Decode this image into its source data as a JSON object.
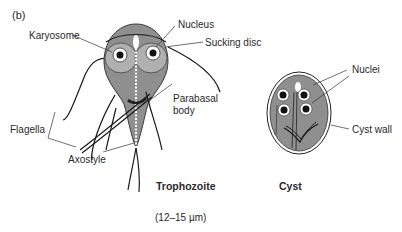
{
  "figure": {
    "panel_label": "(b)",
    "labels": {
      "karyosome": "Karyosome",
      "nucleus": "Nucleus",
      "sucking_disc": "Sucking disc",
      "parabasal_body_line1": "Parabasal",
      "parabasal_body_line2": "body",
      "flagella": "Flagella",
      "axostyle": "Axostyle",
      "nuclei": "Nuclei",
      "cyst_wall": "Cyst wall"
    },
    "captions": {
      "trophozoite": "Trophozoite",
      "cyst": "Cyst",
      "size": "(12–15 µm)"
    },
    "colors": {
      "body_fill": "#8f8f8f",
      "disc_fill": "#b5b5b5",
      "outline": "#1a1a1a",
      "nucleus_fill": "#ffffff",
      "karyosome_fill": "#111111"
    }
  }
}
